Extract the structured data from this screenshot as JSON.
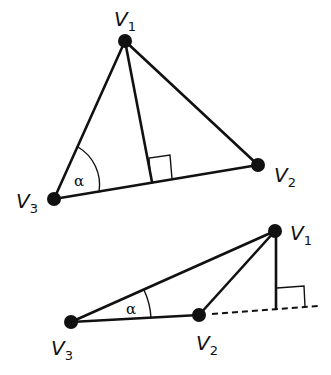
{
  "diagrams": [
    {
      "name": "acute-triangle",
      "vertices": [
        {
          "id": "V1",
          "letter": "V",
          "sub": "1",
          "x": 125,
          "y": 41,
          "lx": 114,
          "ly": 26
        },
        {
          "id": "V2",
          "letter": "V",
          "sub": "2",
          "x": 258,
          "y": 165,
          "lx": 274,
          "ly": 182
        },
        {
          "id": "V3",
          "letter": "V",
          "sub": "3",
          "x": 54,
          "y": 199,
          "lx": 16,
          "ly": 208
        }
      ],
      "altitude_foot": {
        "x": 152,
        "y": 182
      },
      "angle_label": "α",
      "angle_label_pos": {
        "x": 74,
        "y": 186
      }
    },
    {
      "name": "obtuse-triangle",
      "vertices": [
        {
          "id": "V1",
          "letter": "V",
          "sub": "1",
          "x": 275,
          "y": 231,
          "lx": 290,
          "ly": 240
        },
        {
          "id": "V2",
          "letter": "V",
          "sub": "2",
          "x": 199,
          "y": 315,
          "lx": 196,
          "ly": 350
        },
        {
          "id": "V3",
          "letter": "V",
          "sub": "3",
          "x": 71,
          "y": 322,
          "lx": 51,
          "ly": 355
        }
      ],
      "altitude_foot": {
        "x": 276,
        "y": 309
      },
      "extension_end": {
        "x": 318,
        "y": 306
      },
      "angle_label": "α",
      "angle_label_pos": {
        "x": 126,
        "y": 314
      }
    }
  ],
  "colors": {
    "stroke": "#111111",
    "background": "#ffffff"
  }
}
